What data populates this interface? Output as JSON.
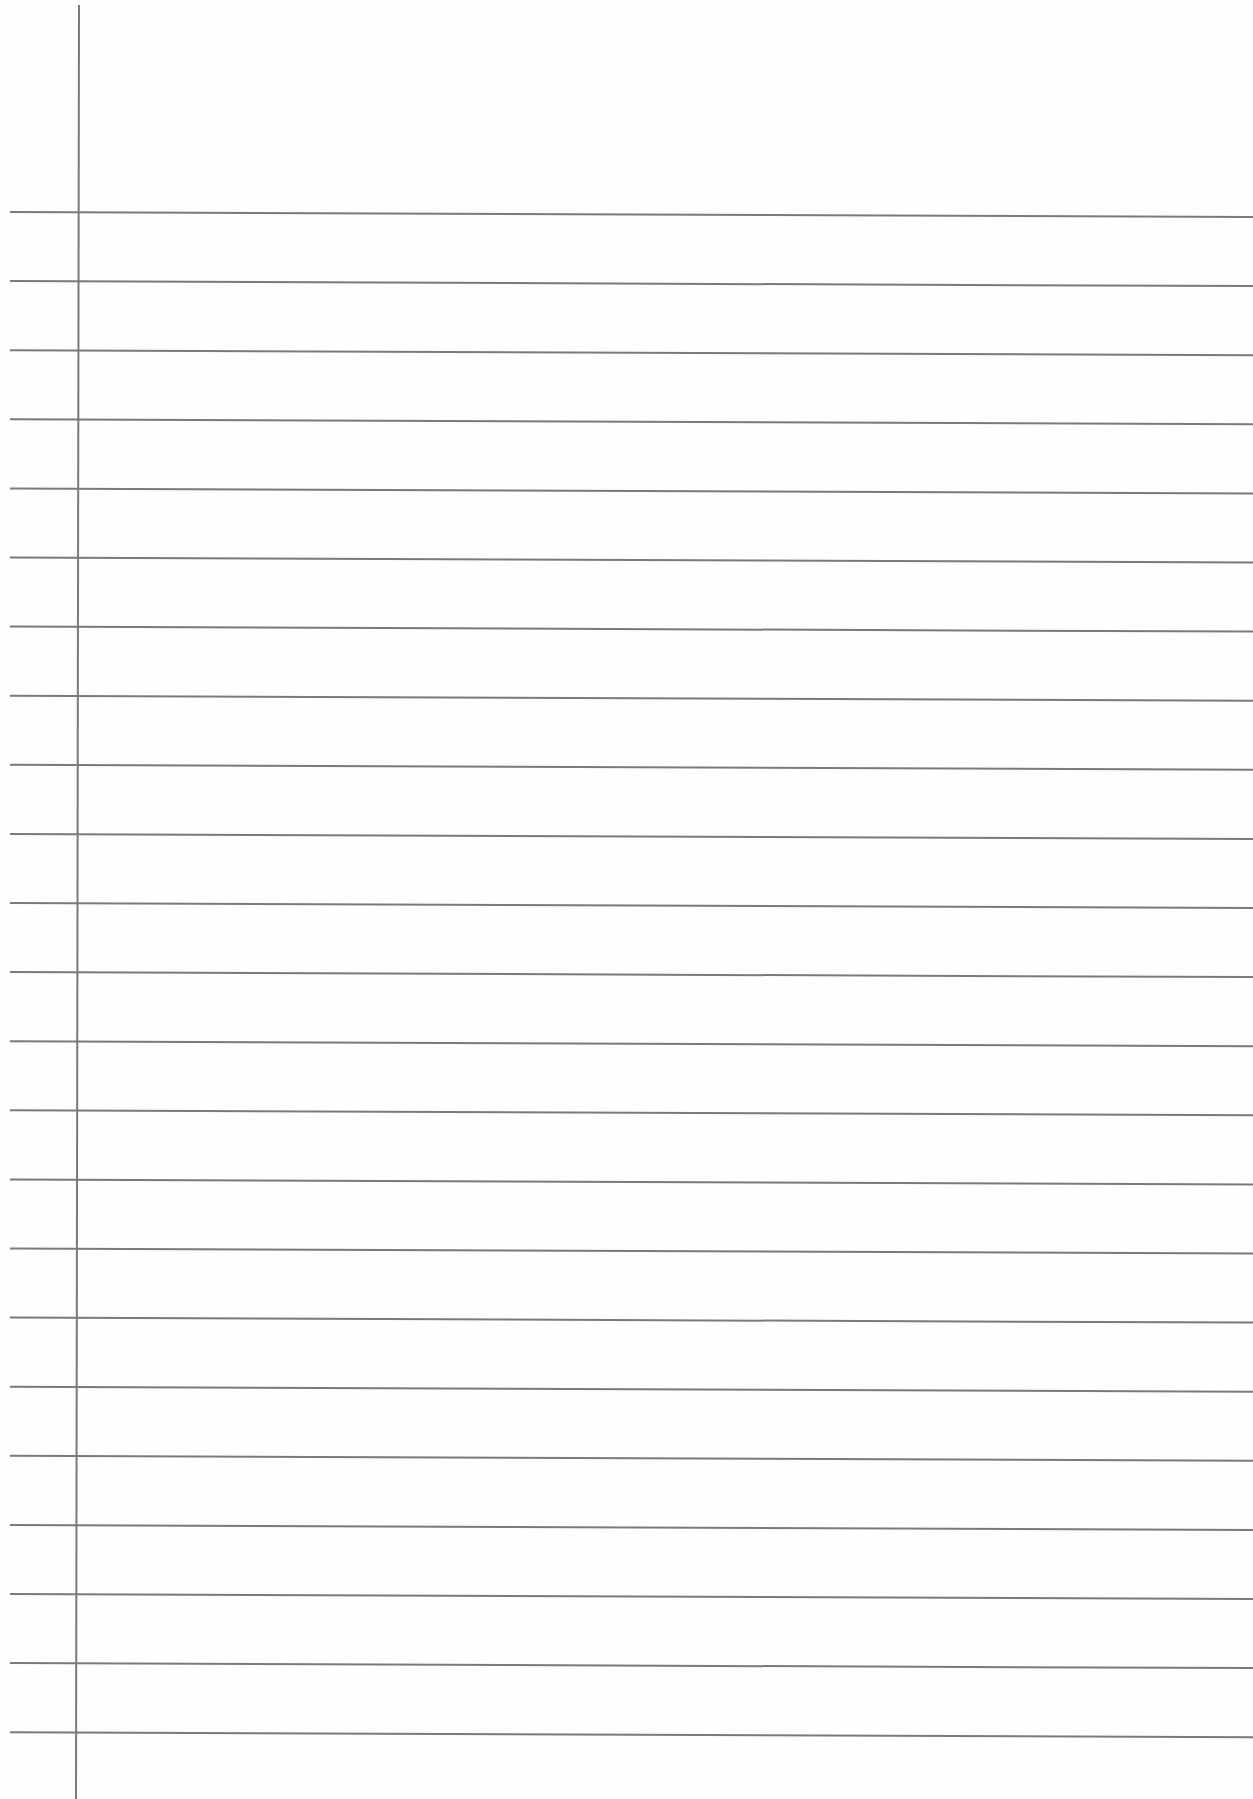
{
  "page": {
    "type": "ruled-notebook-paper",
    "width": 1253,
    "height": 1799,
    "background_color": "#fefefe",
    "line_color": "#7a7a7a"
  },
  "margin_line": {
    "x_top": 79,
    "x_bottom": 76,
    "y_start": 5,
    "y_end": 1799
  },
  "ruled_lines": {
    "count": 23,
    "first_y_left": 212,
    "spacing": 69.1,
    "x_start": 10,
    "x_end": 1253,
    "right_drop": 5
  }
}
